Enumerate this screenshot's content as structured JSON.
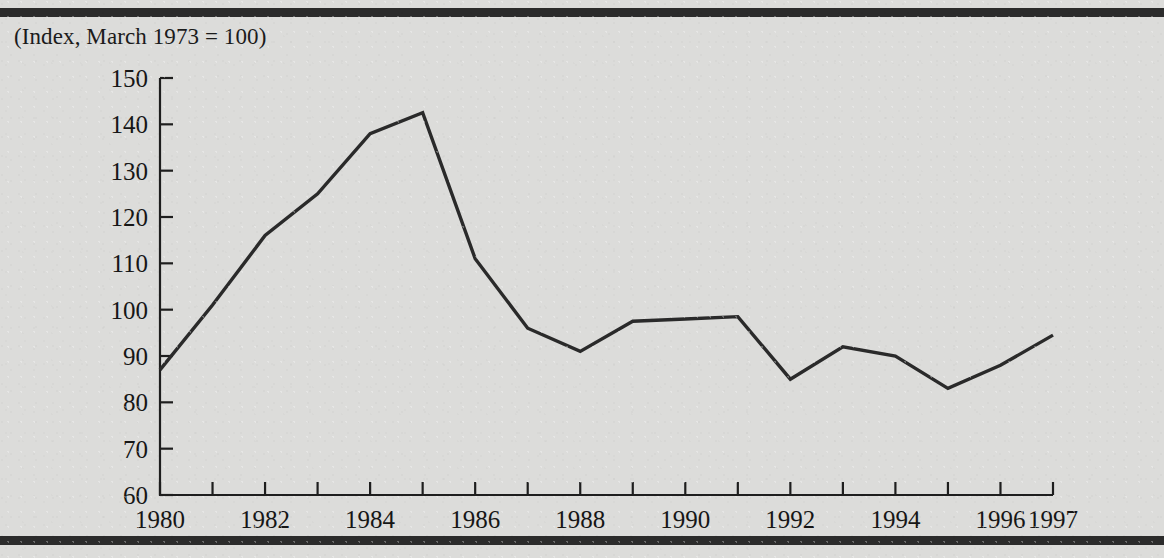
{
  "page": {
    "background_color": "#dcdcda",
    "rule_color": "#2b2b2b"
  },
  "chart_data": {
    "type": "line",
    "title": "(Index, March 1973 = 100)",
    "xlabel": "",
    "ylabel": "",
    "line_color": "#2a2a2a",
    "grid": false,
    "legend": "none",
    "xlim": [
      1980,
      1997
    ],
    "ylim": [
      60,
      150
    ],
    "yticks": [
      60,
      70,
      80,
      90,
      100,
      110,
      120,
      130,
      140,
      150
    ],
    "ytick_labels": [
      "60",
      "70",
      "80",
      "90",
      "100",
      "110",
      "120",
      "130",
      "140",
      "150"
    ],
    "xticks": [
      1980,
      1981,
      1982,
      1983,
      1984,
      1985,
      1986,
      1987,
      1988,
      1989,
      1990,
      1991,
      1992,
      1993,
      1994,
      1995,
      1996,
      1997
    ],
    "xtick_labels": [
      "1980",
      "",
      "1982",
      "",
      "1984",
      "",
      "1986",
      "",
      "1988",
      "",
      "1990",
      "",
      "1992",
      "",
      "1994",
      "",
      "1996",
      "1997"
    ],
    "x": [
      1980,
      1981,
      1982,
      1983,
      1984,
      1985,
      1986,
      1987,
      1988,
      1989,
      1990,
      1991,
      1992,
      1993,
      1994,
      1995,
      1996,
      1997
    ],
    "values": [
      87,
      101,
      116,
      125,
      138,
      142.5,
      111,
      96,
      91,
      97.5,
      98,
      98.5,
      85,
      92,
      90,
      83,
      88,
      94.5
    ]
  }
}
